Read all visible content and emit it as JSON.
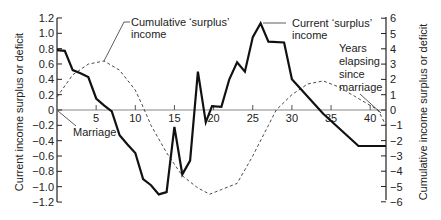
{
  "chart_data": {
    "type": "line",
    "title": "",
    "xlabel": "Years elapsing since marriage",
    "ylabel_left": "Current income surplus or deficit",
    "ylabel_right": "Cumulative income surplus or deficit",
    "xlim": [
      0,
      42
    ],
    "ylim_left": [
      -1.2,
      1.2
    ],
    "ylim_right": [
      -6,
      6
    ],
    "x_ticks": [
      5,
      10,
      15,
      20,
      25,
      30,
      35,
      40
    ],
    "y_ticks_left": [
      "1.2",
      "1.0",
      "0.8",
      "0.6",
      "0.4",
      "0.2",
      "0",
      "−0.2",
      "−0.4",
      "−0.6",
      "−0.8",
      "−1.0",
      "−1.2"
    ],
    "y_ticks_right": [
      "6",
      "5",
      "4",
      "3",
      "2",
      "1",
      "0",
      "−1",
      "−2",
      "−3",
      "−4",
      "−5",
      "−6"
    ],
    "grid": false,
    "series": [
      {
        "name": "Current 'surplus' income",
        "axis": "left",
        "style": "solid",
        "points": [
          [
            0,
            0.78
          ],
          [
            1,
            0.77
          ],
          [
            2,
            0.52
          ],
          [
            3,
            0.48
          ],
          [
            4,
            0.43
          ],
          [
            5,
            0.15
          ],
          [
            6,
            0.06
          ],
          [
            7,
            -0.02
          ],
          [
            8,
            -0.33
          ],
          [
            9,
            -0.45
          ],
          [
            10,
            -0.56
          ],
          [
            11,
            -0.9
          ],
          [
            12,
            -0.98
          ],
          [
            13,
            -1.1
          ],
          [
            14,
            -1.07
          ],
          [
            15,
            -0.22
          ],
          [
            16,
            -0.84
          ],
          [
            17,
            -0.66
          ],
          [
            18,
            0.5
          ],
          [
            19,
            -0.16
          ],
          [
            19.8,
            0.05
          ],
          [
            21,
            0.04
          ],
          [
            22,
            0.4
          ],
          [
            23,
            0.62
          ],
          [
            24,
            0.5
          ],
          [
            25,
            0.95
          ],
          [
            26,
            1.13
          ],
          [
            27,
            0.89
          ],
          [
            29,
            0.88
          ],
          [
            30,
            0.4
          ],
          [
            34,
            -0.05
          ],
          [
            38.5,
            -0.47
          ],
          [
            42,
            -0.47
          ]
        ]
      },
      {
        "name": "Cumulative 'surplus' income",
        "axis": "right",
        "style": "dashed",
        "points": [
          [
            0,
            0.85
          ],
          [
            2,
            2.3
          ],
          [
            4,
            3.0
          ],
          [
            6,
            3.2
          ],
          [
            8,
            2.6
          ],
          [
            10,
            1.3
          ],
          [
            11,
            0.2
          ],
          [
            12,
            -1.0
          ],
          [
            14,
            -2.8
          ],
          [
            16,
            -4.3
          ],
          [
            18,
            -5.1
          ],
          [
            19.5,
            -5.5
          ],
          [
            21,
            -5.2
          ],
          [
            23,
            -4.8
          ],
          [
            25,
            -3.0
          ],
          [
            27,
            -1.0
          ],
          [
            28,
            0
          ],
          [
            30,
            1.0
          ],
          [
            32,
            1.7
          ],
          [
            34,
            1.9
          ],
          [
            36,
            1.5
          ],
          [
            38,
            0.9
          ],
          [
            40,
            0.3
          ],
          [
            41,
            0
          ],
          [
            42,
            -1.0
          ]
        ]
      }
    ],
    "annotations": [
      {
        "text_lines": [
          "Cumulative 'surplus'",
          "income"
        ],
        "points_to": "Cumulative 'surplus' income"
      },
      {
        "text_lines": [
          "Current 'surplus'",
          "income"
        ],
        "points_to": "Current 'surplus' income peak"
      },
      {
        "text_lines": [
          "Years",
          "elapsing",
          "since",
          "marriage"
        ],
        "points_to": "x-axis"
      },
      {
        "text_lines": [
          "Marriage"
        ],
        "points_to": "origin"
      }
    ]
  },
  "labels": {
    "left_axis_title": "Current income surplus or deficit",
    "right_axis_title": "Cumulative income surplus or deficit",
    "annot_cum_1": "Cumulative ‘surplus’",
    "annot_cum_2": "income",
    "annot_cur_1": "Current ‘surplus’",
    "annot_cur_2": "income",
    "annot_years_1": "Years",
    "annot_years_2": "elapsing",
    "annot_years_3": "since",
    "annot_years_4": "marriage",
    "annot_marriage": "Marriage"
  }
}
